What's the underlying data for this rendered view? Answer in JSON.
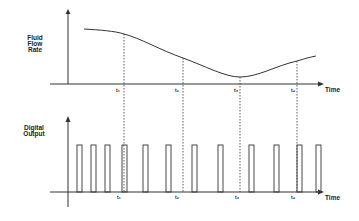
{
  "diagram": {
    "top_panel": {
      "y_label_lines": [
        "Fluid",
        "Flow",
        "Rate"
      ],
      "x_label": "Time",
      "curve_description": "fluid flow rate decreasing then rising over time"
    },
    "bottom_panel": {
      "y_label_lines": [
        "Digital",
        "Output"
      ],
      "x_label": "Time",
      "pulse_count": 12
    },
    "time_markers": [
      "t₁",
      "t₂",
      "t₃",
      "t₄"
    ],
    "colors": {
      "line": "#333333",
      "background": "#ffffff"
    }
  }
}
